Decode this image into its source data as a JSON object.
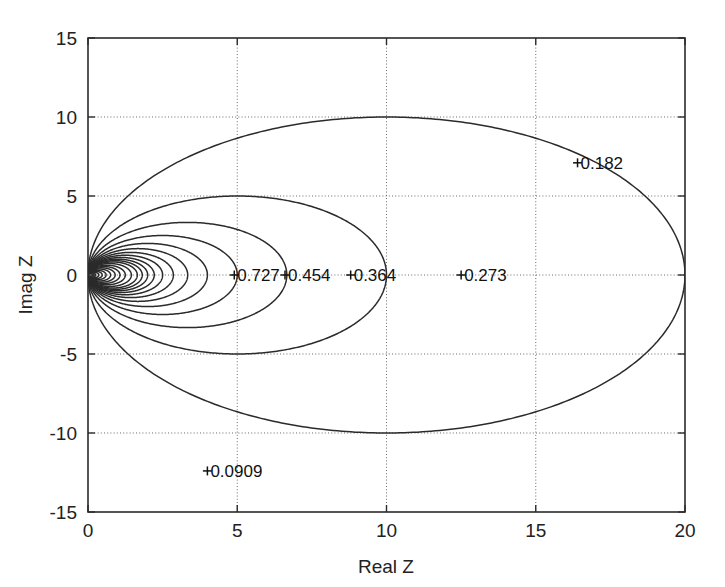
{
  "figure": {
    "title": "",
    "background": "#ffffff",
    "line_color": "#2b2b2b",
    "grid_color": "#6a6a6a"
  },
  "chart_data": {
    "type": "line",
    "plot_kind": "contour",
    "title": "",
    "subtitle": "",
    "xlabel": "Real Z",
    "ylabel": "Imag Z",
    "xlim": [
      0,
      20
    ],
    "ylim": [
      -15,
      15
    ],
    "xticks": [
      0,
      5,
      10,
      15,
      20
    ],
    "yticks": [
      -15,
      -10,
      -5,
      0,
      5,
      10,
      15
    ],
    "xticklabels": [
      "0",
      "5",
      "10",
      "15",
      "20"
    ],
    "yticklabels": [
      "-15",
      "-10",
      "-5",
      "0",
      "5",
      "10",
      "15"
    ],
    "grid": true,
    "grid_style": "dotted",
    "legend": null,
    "legend_position": "none",
    "contours": [
      {
        "level": 0.0909,
        "label": "0.0909",
        "center_real": 10.0,
        "radius": 10.0,
        "diameter_real": 20.0,
        "labeled": true,
        "label_x": 4.0,
        "label_y": -12.4,
        "marker": true,
        "clipped": true
      },
      {
        "level": 0.182,
        "label": "0.182",
        "center_real": 5.0,
        "radius": 5.0,
        "diameter_real": 10.0,
        "labeled": true,
        "label_x": 16.4,
        "label_y": 7.1,
        "marker": true,
        "clipped": false
      },
      {
        "level": 0.273,
        "label": "0.273",
        "center_real": 3.33,
        "radius": 3.33,
        "diameter_real": 6.67,
        "labeled": true,
        "label_x": 12.5,
        "label_y": 0.0,
        "marker": true,
        "clipped": false
      },
      {
        "level": 0.364,
        "label": "0.364",
        "center_real": 2.5,
        "radius": 2.5,
        "diameter_real": 5.0,
        "labeled": true,
        "label_x": 8.8,
        "label_y": 0.0,
        "marker": true,
        "clipped": false
      },
      {
        "level": 0.454,
        "label": "0.454",
        "center_real": 2.0,
        "radius": 2.0,
        "diameter_real": 4.0,
        "labeled": true,
        "label_x": 6.6,
        "label_y": 0.0,
        "marker": true,
        "clipped": false
      },
      {
        "level": 0.545,
        "label": "0.545",
        "center_real": 1.67,
        "radius": 1.67,
        "diameter_real": 3.33,
        "labeled": false,
        "label_x": null,
        "label_y": null,
        "marker": false,
        "clipped": false
      },
      {
        "level": 0.636,
        "label": "0.636",
        "center_real": 1.43,
        "radius": 1.43,
        "diameter_real": 2.86,
        "labeled": false,
        "label_x": null,
        "label_y": null,
        "marker": false,
        "clipped": false
      },
      {
        "level": 0.727,
        "label": "0.727",
        "center_real": 1.25,
        "radius": 1.25,
        "diameter_real": 2.5,
        "labeled": true,
        "label_x": 4.9,
        "label_y": 0.0,
        "marker": true,
        "clipped": false
      },
      {
        "level": 0.818,
        "label": "0.818",
        "center_real": 1.11,
        "radius": 1.11,
        "diameter_real": 2.22,
        "labeled": false,
        "label_x": null,
        "label_y": null,
        "marker": false,
        "clipped": false
      },
      {
        "level": 0.909,
        "label": "0.909",
        "center_real": 1.0,
        "radius": 1.0,
        "diameter_real": 2.0,
        "labeled": false,
        "label_x": null,
        "label_y": null,
        "marker": false,
        "clipped": false
      },
      {
        "level": 1.0,
        "label": "1.0",
        "center_real": 0.909,
        "radius": 0.909,
        "diameter_real": 1.82,
        "labeled": false,
        "label_x": null,
        "label_y": null,
        "marker": false,
        "clipped": false
      },
      {
        "level": 1.1,
        "label": "1.1",
        "center_real": 0.826,
        "radius": 0.826,
        "diameter_real": 1.65,
        "labeled": false,
        "label_x": null,
        "label_y": null,
        "marker": false,
        "clipped": false
      },
      {
        "level": 1.25,
        "label": "1.25",
        "center_real": 0.727,
        "radius": 0.727,
        "diameter_real": 1.45,
        "labeled": false,
        "label_x": null,
        "label_y": null,
        "marker": false,
        "clipped": false
      },
      {
        "level": 1.45,
        "label": "1.45",
        "center_real": 0.625,
        "radius": 0.625,
        "diameter_real": 1.25,
        "labeled": false,
        "label_x": null,
        "label_y": null,
        "marker": false,
        "clipped": false
      },
      {
        "level": 1.7,
        "label": "1.7",
        "center_real": 0.536,
        "radius": 0.536,
        "diameter_real": 1.07,
        "labeled": false,
        "label_x": null,
        "label_y": null,
        "marker": false,
        "clipped": false
      },
      {
        "level": 2.0,
        "label": "2.0",
        "center_real": 0.455,
        "radius": 0.455,
        "diameter_real": 0.91,
        "labeled": false,
        "label_x": null,
        "label_y": null,
        "marker": false,
        "clipped": false
      },
      {
        "level": 2.4,
        "label": "2.4",
        "center_real": 0.379,
        "radius": 0.379,
        "diameter_real": 0.76,
        "labeled": false,
        "label_x": null,
        "label_y": null,
        "marker": false,
        "clipped": false
      },
      {
        "level": 3.0,
        "label": "3.0",
        "center_real": 0.303,
        "radius": 0.303,
        "diameter_real": 0.61,
        "labeled": false,
        "label_x": null,
        "label_y": null,
        "marker": false,
        "clipped": false
      },
      {
        "level": 3.8,
        "label": "3.8",
        "center_real": 0.239,
        "radius": 0.239,
        "diameter_real": 0.48,
        "labeled": false,
        "label_x": null,
        "label_y": null,
        "marker": false,
        "clipped": false
      },
      {
        "level": 5.0,
        "label": "5.0",
        "center_real": 0.182,
        "radius": 0.182,
        "diameter_real": 0.36,
        "labeled": false,
        "label_x": null,
        "label_y": null,
        "marker": false,
        "clipped": false
      },
      {
        "level": 7.0,
        "label": "7.0",
        "center_real": 0.13,
        "radius": 0.13,
        "diameter_real": 0.26,
        "labeled": false,
        "label_x": null,
        "label_y": null,
        "marker": false,
        "clipped": false
      },
      {
        "level": 10.0,
        "label": "10.0",
        "center_real": 0.091,
        "radius": 0.091,
        "diameter_real": 0.18,
        "labeled": false,
        "label_x": null,
        "label_y": null,
        "marker": false,
        "clipped": false
      }
    ],
    "labeled_levels": [
      "0.0909",
      "0.182",
      "0.273",
      "0.364",
      "0.454",
      "0.727"
    ],
    "markers": [
      {
        "label": "0.0909",
        "x": 4.0,
        "y": -12.4
      },
      {
        "label": "0.182",
        "x": 16.4,
        "y": 7.1
      },
      {
        "label": "0.273",
        "x": 12.5,
        "y": 0.0
      },
      {
        "label": "0.364",
        "x": 8.8,
        "y": 0.0
      },
      {
        "label": "0.454",
        "x": 6.6,
        "y": 0.0
      },
      {
        "label": "0.727",
        "x": 4.9,
        "y": 0.0
      }
    ]
  }
}
